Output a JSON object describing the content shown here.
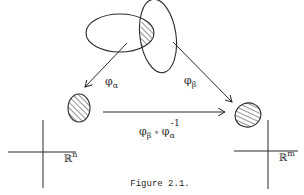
{
  "figure": {
    "caption": "Figure 2.1.",
    "labels": {
      "phi_alpha": {
        "base": "φ",
        "sub": "α"
      },
      "phi_beta": {
        "base": "φ",
        "sub": "β"
      },
      "transition": {
        "base1": "φ",
        "sub1": "β",
        "op": "∘",
        "base2": "φ",
        "sub2": "α",
        "sup2": "-1"
      },
      "rn": {
        "base": "ℝ",
        "sup": "n"
      },
      "rm": {
        "base": "ℝ",
        "sup": "m"
      }
    },
    "colors": {
      "ink": "#2a2a2a",
      "background": "#ffffff"
    }
  }
}
